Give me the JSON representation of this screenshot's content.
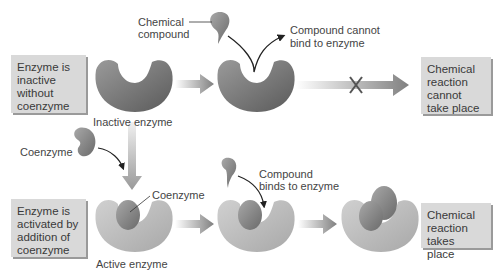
{
  "boxes": {
    "inactive": "Enzyme is inactive without coenzyme",
    "cannot": "Chemical reaction cannot take place",
    "activated": "Enzyme is activated by addition of coenzyme",
    "takes": "Chemical reaction takes place"
  },
  "labels": {
    "chemical_compound_1": "Chemical",
    "chemical_compound_2": "compound",
    "cannot_bind_1": "Compound cannot",
    "cannot_bind_2": "bind to enzyme",
    "inactive_enzyme": "Inactive enzyme",
    "coenzyme_top": "Coenzyme",
    "coenzyme_bound": "Coenzyme",
    "binds_1": "Compound",
    "binds_2": "binds to enzyme",
    "active_enzyme": "Active enzyme"
  },
  "colors": {
    "box_bg": "#d9d9d9",
    "enzyme_dark": "#6e6e6e",
    "enzyme_light": "#bdbdbd",
    "arrow": "#8a8a8a"
  }
}
